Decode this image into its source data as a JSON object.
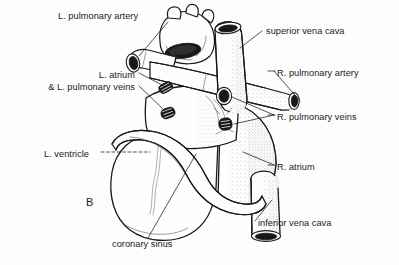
{
  "figure": {
    "panel_letter": "B",
    "background_color": "#fdfdfe",
    "ink_color": "#17181a"
  },
  "labels": [
    {
      "id": "l-pulmonary-artery",
      "text": "L. pulmonary artery",
      "align": "left",
      "x": 58,
      "y": 17
    },
    {
      "id": "superior-vena-cava",
      "text": "superior vena cava",
      "align": "left",
      "x": 266,
      "y": 32
    },
    {
      "id": "l-atrium-and-veins-line1",
      "text": "L. atrium",
      "align": "right",
      "x": 70,
      "y": 76
    },
    {
      "id": "l-atrium-and-veins-line2",
      "text": "& L. pulmonary veins",
      "align": "right",
      "x": 70,
      "y": 88
    },
    {
      "id": "r-pulmonary-artery",
      "text": "R. pulmonary artery",
      "align": "left",
      "x": 277,
      "y": 74
    },
    {
      "id": "r-pulmonary-veins",
      "text": "R. pulmonary veins",
      "align": "left",
      "x": 277,
      "y": 118
    },
    {
      "id": "l-ventricle",
      "text": "L. ventricle",
      "align": "left",
      "x": 44,
      "y": 155
    },
    {
      "id": "r-atrium",
      "text": "R. atrium",
      "align": "left",
      "x": 277,
      "y": 168
    },
    {
      "id": "inferior-vena-cava",
      "text": "inferior vena cava",
      "align": "left",
      "x": 258,
      "y": 224
    },
    {
      "id": "coronary-sinus",
      "text": "coronary sinus",
      "align": "left",
      "x": 112,
      "y": 245
    }
  ],
  "structures": [
    "left pulmonary artery stump",
    "right pulmonary artery stump",
    "superior vena cava stump",
    "inferior vena cava stump",
    "left pulmonary vein openings",
    "right pulmonary vein openings",
    "left atrium",
    "right atrium",
    "left ventricle",
    "coronary sinus"
  ]
}
